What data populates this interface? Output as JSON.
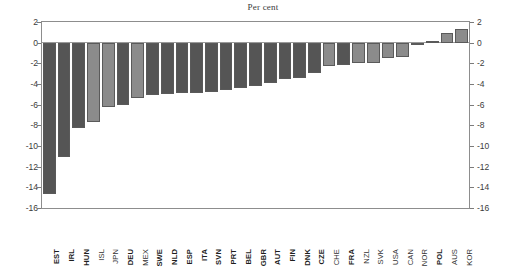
{
  "chart_data": {
    "type": "bar",
    "title": "Per cent",
    "xlabel": "",
    "ylabel": "",
    "ylim": [
      -16,
      2
    ],
    "yticks": [
      2,
      0,
      -2,
      -4,
      -6,
      -8,
      -10,
      -12,
      -14,
      -16
    ],
    "ytick_labels": [
      "2",
      "0",
      "-2",
      "-4",
      "-6",
      "-8",
      "-10",
      "-12",
      "-14",
      "-16"
    ],
    "right_axis": true,
    "grid": false,
    "legend": null,
    "categories": [
      "EST",
      "IRL",
      "HUN",
      "ISL",
      "JPN",
      "DEU",
      "MEX",
      "SWE",
      "NLD",
      "ESP",
      "ITA",
      "SVN",
      "PRT",
      "BEL",
      "GBR",
      "AUT",
      "FIN",
      "DNK",
      "CZE",
      "CHE",
      "FRA",
      "NZL",
      "SVK",
      "USA",
      "CAN",
      "NOR",
      "POL",
      "AUS",
      "KOR"
    ],
    "values": [
      -14.6,
      -11.1,
      -8.3,
      -7.7,
      -6.2,
      -6.0,
      -5.4,
      -5.1,
      -5.0,
      -4.9,
      -4.9,
      -4.8,
      -4.6,
      -4.4,
      -4.2,
      -3.9,
      -3.5,
      -3.4,
      -2.9,
      -2.3,
      -2.2,
      -2.0,
      -2.0,
      -1.5,
      -1.4,
      -0.2,
      0.15,
      0.9,
      1.3
    ],
    "bar_shades": [
      "dark",
      "dark",
      "dark",
      "light",
      "light",
      "dark",
      "light",
      "dark",
      "dark",
      "dark",
      "dark",
      "dark",
      "dark",
      "dark",
      "dark",
      "dark",
      "dark",
      "dark",
      "dark",
      "light",
      "dark",
      "light",
      "light",
      "light",
      "light",
      "light",
      "dark",
      "light",
      "light"
    ],
    "colors": {
      "bar_dark": "#555555",
      "bar_light": "#8b8b8b",
      "bar_edge": "#5a5a5a",
      "axis": "#8d8d8d",
      "text": "#333333"
    }
  },
  "axis": {
    "left_ticks": [
      "2",
      "0",
      "-2",
      "-4",
      "-6",
      "-8",
      "-10",
      "-12",
      "-14",
      "-16"
    ],
    "right_ticks": [
      "2",
      "0",
      "-2",
      "-4",
      "-6",
      "-8",
      "-10",
      "-12",
      "-14",
      "-16"
    ]
  }
}
